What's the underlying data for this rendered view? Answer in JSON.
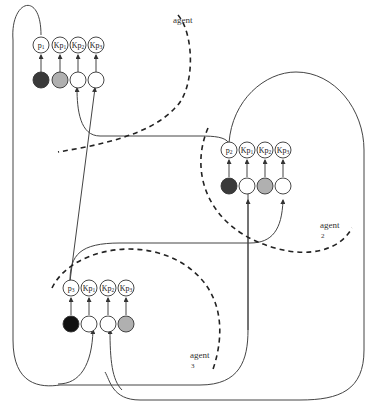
{
  "diagram": {
    "agents": [
      {
        "id": "agent1",
        "label": "agent",
        "number": "",
        "labels": [
          {
            "main": "p",
            "sub": "1"
          },
          {
            "main": "Kp",
            "sub": "1"
          },
          {
            "main": "Kp",
            "sub": "2"
          },
          {
            "main": "Kp",
            "sub": "3"
          }
        ],
        "states": [
          "dark",
          "gray",
          "white",
          "white"
        ]
      },
      {
        "id": "agent2",
        "label": "agent",
        "number": "2",
        "labels": [
          {
            "main": "p",
            "sub": "2"
          },
          {
            "main": "Kp",
            "sub": "1"
          },
          {
            "main": "Kp",
            "sub": "2"
          },
          {
            "main": "Kp",
            "sub": "3"
          }
        ],
        "states": [
          "dark",
          "white",
          "gray",
          "white"
        ]
      },
      {
        "id": "agent3",
        "label": "agent",
        "number": "3",
        "labels": [
          {
            "main": "p",
            "sub": "3"
          },
          {
            "main": "Kp",
            "sub": "1"
          },
          {
            "main": "Kp",
            "sub": "2"
          },
          {
            "main": "Kp",
            "sub": "3"
          }
        ],
        "states": [
          "black",
          "white",
          "white",
          "gray"
        ]
      }
    ],
    "colors": {
      "dark": "#3a3a3a",
      "black": "#111111",
      "gray": "#b0b0b0",
      "white": "#ffffff",
      "line": "#444444"
    }
  }
}
